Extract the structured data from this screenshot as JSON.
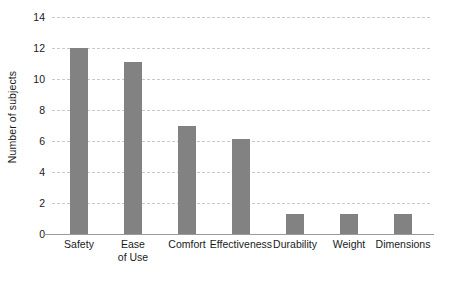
{
  "chart_data": {
    "type": "bar",
    "title": "",
    "subtitle": "",
    "xlabel": "",
    "ylabel": "Number of subjects",
    "categories": [
      "Safety",
      "Ease\nof Use",
      "Comfort",
      "Effectiveness",
      "Durability",
      "Weight",
      "Dimensions"
    ],
    "values": [
      12,
      11.1,
      7,
      6.1,
      1.3,
      1.3,
      1.3
    ],
    "ylim": [
      0,
      14
    ],
    "ytick_labels": [
      "0",
      "2",
      "4",
      "6",
      "8",
      "10",
      "12",
      "14"
    ],
    "ytick_values": [
      0,
      2,
      4,
      6,
      8,
      10,
      12,
      14
    ],
    "grid": "horizontal-dashed",
    "legend": "none",
    "bar_color": "#828282",
    "gridline_color": "#c9c9c9",
    "axis_color": "#9a9a9a",
    "text_color": "#1a1a1a",
    "background": "#ffffff"
  }
}
